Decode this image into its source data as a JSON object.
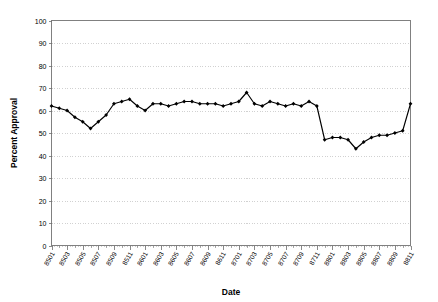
{
  "chart_data": {
    "type": "line",
    "title": "",
    "xlabel": "Date",
    "ylabel": "Percent Approval",
    "ylim": [
      0,
      100
    ],
    "ytick_step": 10,
    "yticks": [
      0,
      10,
      20,
      30,
      40,
      50,
      60,
      70,
      80,
      90,
      100
    ],
    "grid": true,
    "legend": false,
    "legend_position": "none",
    "marker": "diamond",
    "line_color": "#000000",
    "x": [
      "8501",
      "8502",
      "8503",
      "8504",
      "8505",
      "8506",
      "8507",
      "8508",
      "8509",
      "8510",
      "8511",
      "8512",
      "8601",
      "8602",
      "8603",
      "8604",
      "8605",
      "8606",
      "8607",
      "8608",
      "8609",
      "8610",
      "8611",
      "8612",
      "8701",
      "8702",
      "8703",
      "8704",
      "8705",
      "8706",
      "8707",
      "8708",
      "8709",
      "8710",
      "8711",
      "8712",
      "8801",
      "8802",
      "8803",
      "8804",
      "8805",
      "8806",
      "8807",
      "8808",
      "8809",
      "8810",
      "8811"
    ],
    "xtick_labels": [
      "8501",
      "8503",
      "8505",
      "8507",
      "8509",
      "8511",
      "8601",
      "8603",
      "8605",
      "8607",
      "8609",
      "8611",
      "8701",
      "8703",
      "8705",
      "8707",
      "8709",
      "8711",
      "8801",
      "8803",
      "8805",
      "8807",
      "8809",
      "8811"
    ],
    "xtick_interval_months": 2,
    "values": [
      62,
      61,
      60,
      57,
      55,
      52,
      55,
      58,
      63,
      64,
      65,
      62,
      60,
      63,
      63,
      62,
      63,
      64,
      64,
      63,
      63,
      63,
      62,
      63,
      64,
      68,
      63,
      62,
      64,
      63,
      62,
      63,
      62,
      64,
      62,
      47,
      48,
      48,
      47,
      43,
      46,
      48,
      49,
      49,
      50,
      51,
      63
    ],
    "series": [
      {
        "name": "Percent Approval",
        "values": [
          62,
          61,
          60,
          57,
          55,
          52,
          55,
          58,
          63,
          64,
          65,
          62,
          60,
          63,
          63,
          62,
          63,
          64,
          64,
          63,
          63,
          63,
          62,
          63,
          64,
          68,
          63,
          62,
          64,
          63,
          62,
          63,
          62,
          64,
          62,
          47,
          48,
          48,
          47,
          43,
          46,
          48,
          49,
          49,
          50,
          51,
          63
        ]
      }
    ]
  },
  "axes": {
    "y_title": "Percent Approval",
    "x_title": "Date"
  }
}
